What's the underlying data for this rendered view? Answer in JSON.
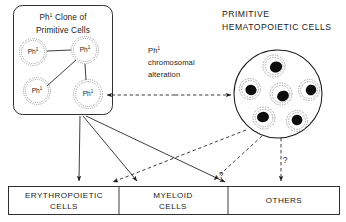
{
  "figure": {
    "type": "diagram"
  },
  "clone_box": {
    "title_line1": "Ph1 Clone of",
    "title_line2": "Primitive Cells",
    "cell_label": "Ph",
    "cell_superscript": "1",
    "cells": [
      {
        "id": "clone-cell-upper-left",
        "cx": 33,
        "cy": 52,
        "r": 13.5
      },
      {
        "id": "clone-cell-upper-right",
        "cx": 85,
        "cy": 50,
        "r": 13.5
      },
      {
        "id": "clone-cell-lower-left",
        "cx": 37,
        "cy": 91,
        "r": 13.5
      },
      {
        "id": "clone-cell-lower-right",
        "cx": 88,
        "cy": 94,
        "r": 14.5
      }
    ]
  },
  "middle_label": {
    "line1": "Ph1",
    "line1_base": "Ph",
    "line1_sup": "1",
    "line2": "chromosomal",
    "line3": "alteration"
  },
  "primitive_panel": {
    "title_line1": "PRIMITIVE",
    "title_line2": "HEMATOPOIETIC CELLS",
    "circle": {
      "cx": 278,
      "cy": 94,
      "r": 44
    },
    "cells": [
      {
        "id": "hcell-top",
        "cx": 274,
        "cy": 66,
        "r": 11
      },
      {
        "id": "hcell-left",
        "cx": 250,
        "cy": 89,
        "r": 10.5
      },
      {
        "id": "hcell-center",
        "cx": 281,
        "cy": 94,
        "r": 11
      },
      {
        "id": "hcell-right",
        "cx": 309,
        "cy": 90,
        "r": 10.5
      },
      {
        "id": "hcell-bottom-left",
        "cx": 264,
        "cy": 118,
        "r": 11
      },
      {
        "id": "hcell-bottom-right",
        "cx": 297,
        "cy": 121,
        "r": 10.5
      }
    ]
  },
  "outcome_boxes": [
    {
      "id": "erythropoietic",
      "line1": "ERYTHROPOIETIC",
      "line2": "CELLS"
    },
    {
      "id": "myeloid",
      "line1": "MYELOID",
      "line2": "CELLS"
    },
    {
      "id": "others",
      "line1": "OTHERS",
      "line2": ""
    }
  ],
  "annotations": {
    "question_left": "?",
    "question_right": "?"
  },
  "colors": {
    "ink": "#1a1a1a",
    "background": "#ffffff",
    "nucleus": "#0d0d0d"
  }
}
